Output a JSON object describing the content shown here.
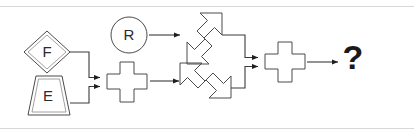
{
  "diagram": {
    "border_color": "#d8d8d8",
    "stroke_color": "#4a4a4a",
    "text_color": "#2b2b2b",
    "background": "#ffffff",
    "nodes": [
      {
        "id": "node-f",
        "icon": "diamond-shape",
        "label": "F",
        "shape": "diamond",
        "double_outline": true,
        "x": 47,
        "y": 52,
        "size": 40
      },
      {
        "id": "node-e",
        "icon": "trapezoid-shape",
        "label": "E",
        "shape": "trapezoid",
        "double_outline": true,
        "x": 47,
        "y": 95,
        "size": 40
      },
      {
        "id": "node-r",
        "icon": "circle-shape",
        "label": "R",
        "shape": "circle",
        "double_outline": false,
        "x": 129,
        "y": 35,
        "size": 36
      },
      {
        "id": "node-cross-1",
        "icon": "cross-shape",
        "label": "",
        "shape": "cross",
        "double_outline": false,
        "x": 127,
        "y": 82,
        "size": 42
      },
      {
        "id": "node-arrow-up",
        "icon": "double-headed-diagonal-arrow-ne-sw",
        "label": "",
        "shape": "diagonal-double-arrow",
        "direction": "ne-sw",
        "x": 201,
        "y": 36,
        "size": 48
      },
      {
        "id": "node-arrow-down",
        "icon": "double-headed-diagonal-arrow-nw-se",
        "label": "",
        "shape": "diagonal-double-arrow",
        "direction": "nw-se",
        "x": 201,
        "y": 86,
        "size": 48
      },
      {
        "id": "node-cross-2",
        "icon": "cross-shape",
        "label": "",
        "shape": "cross",
        "double_outline": false,
        "x": 285,
        "y": 62,
        "size": 42
      },
      {
        "id": "node-question",
        "icon": "question-mark",
        "label": "?",
        "shape": "text",
        "x": 353,
        "y": 60,
        "size": 34
      }
    ],
    "connections": [
      {
        "id": "edge-f-to-cross1",
        "from": "node-f",
        "to": "node-cross-1",
        "style": "elbow",
        "arrow": true
      },
      {
        "id": "edge-e-to-cross1",
        "from": "node-e",
        "to": "node-cross-1",
        "style": "elbow",
        "arrow": true
      },
      {
        "id": "edge-r-to-arrow-up",
        "from": "node-r",
        "to": "node-arrow-up",
        "style": "straight",
        "arrow": true
      },
      {
        "id": "edge-cross1-to-arrow-down",
        "from": "node-cross-1",
        "to": "node-arrow-down",
        "style": "straight",
        "arrow": true
      },
      {
        "id": "edge-arrow-up-to-cross2",
        "from": "node-arrow-up",
        "to": "node-cross-2",
        "style": "elbow",
        "arrow": true
      },
      {
        "id": "edge-arrow-down-to-cross2",
        "from": "node-arrow-down",
        "to": "node-cross-2",
        "style": "elbow",
        "arrow": true
      },
      {
        "id": "edge-cross2-to-question",
        "from": "node-cross-2",
        "to": "node-question",
        "style": "straight",
        "arrow": true
      }
    ]
  }
}
